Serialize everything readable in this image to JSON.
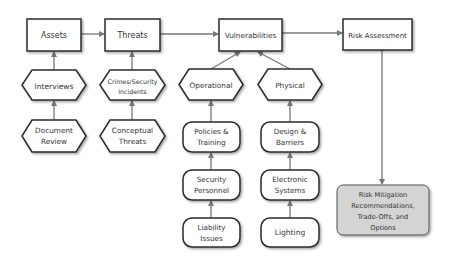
{
  "diagram": {
    "colors": {
      "stroke": "#2b2b2b",
      "arrow": "#777777",
      "box_fill": "#ffffff",
      "output_fill": "#d4d4d4",
      "text": "#333333"
    },
    "top_boxes": {
      "assets": "Assets",
      "threats": "Threats",
      "vulnerabilities": "Vulnerabilities",
      "risk_assessment": "Risk Assessment"
    },
    "hexagons": {
      "interviews": "Interviews",
      "document_review": [
        "Document",
        "Review"
      ],
      "crimes": [
        "Crimes/Security",
        "Incidents"
      ],
      "conceptual_threats": [
        "Conceptual",
        "Threats"
      ],
      "operational": "Operational",
      "physical": "Physical"
    },
    "rounded_boxes": {
      "policies_training": [
        "Policies &",
        "Training"
      ],
      "security_personnel": [
        "Security",
        "Personnel"
      ],
      "liability_issues": [
        "Liability",
        "Issues"
      ],
      "design_barriers": [
        "Design &",
        "Barriers"
      ],
      "electronic_systems": [
        "Electronic",
        "Systems"
      ],
      "lighting": "Lighting"
    },
    "output": {
      "risk_mitigation": [
        "Risk Mitigation",
        "Recommendations,",
        "Trade-Offs, and",
        "Options"
      ]
    },
    "edges": [
      {
        "from": "Assets",
        "to": "Threats"
      },
      {
        "from": "Threats",
        "to": "Vulnerabilities"
      },
      {
        "from": "Vulnerabilities",
        "to": "Risk Assessment"
      },
      {
        "from": "Interviews",
        "to": "Assets"
      },
      {
        "from": "Document Review",
        "to": "Interviews"
      },
      {
        "from": "Crimes/Security Incidents",
        "to": "Threats"
      },
      {
        "from": "Conceptual Threats",
        "to": "Crimes/Security Incidents"
      },
      {
        "from": "Operational",
        "to": "Vulnerabilities"
      },
      {
        "from": "Physical",
        "to": "Vulnerabilities"
      },
      {
        "from": "Policies & Training",
        "to": "Operational"
      },
      {
        "from": "Security Personnel",
        "to": "Policies & Training"
      },
      {
        "from": "Liability Issues",
        "to": "Security Personnel"
      },
      {
        "from": "Design & Barriers",
        "to": "Physical"
      },
      {
        "from": "Electronic Systems",
        "to": "Design & Barriers"
      },
      {
        "from": "Lighting",
        "to": "Electronic Systems"
      },
      {
        "from": "Risk Assessment",
        "to": "Risk Mitigation Recommendations, Trade-Offs, and Options"
      }
    ]
  }
}
